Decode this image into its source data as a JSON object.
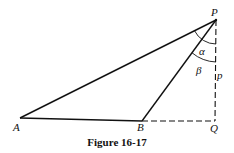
{
  "figure": {
    "caption": "Figure 16-17",
    "points": {
      "P": {
        "label": "P",
        "x": 216,
        "y": 20
      },
      "A": {
        "label": "A",
        "x": 20,
        "y": 118
      },
      "B": {
        "label": "B",
        "x": 142,
        "y": 121
      },
      "Q": {
        "label": "Q",
        "x": 215,
        "y": 121
      }
    },
    "angles": {
      "alpha": {
        "label": "α",
        "vertex": "P",
        "between": [
          "PA",
          "PB"
        ]
      },
      "beta": {
        "label": "β",
        "vertex": "P",
        "between": [
          "PB",
          "PQ"
        ]
      }
    },
    "lengths": {
      "p": {
        "label": "p",
        "segment": "PQ"
      }
    },
    "segments": [
      {
        "from": "A",
        "to": "P",
        "style": "solid"
      },
      {
        "from": "A",
        "to": "B",
        "style": "solid"
      },
      {
        "from": "B",
        "to": "P",
        "style": "solid"
      },
      {
        "from": "B",
        "to": "Q",
        "style": "dashed"
      },
      {
        "from": "P",
        "to": "Q",
        "style": "dashed"
      }
    ],
    "colors": {
      "line": "#111111",
      "background": "#ffffff"
    }
  }
}
